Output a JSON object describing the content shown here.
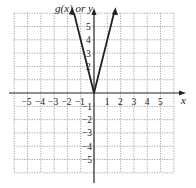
{
  "chart_data": {
    "type": "line",
    "title": "",
    "xlabel": "x",
    "ylabel": "g(x) or y",
    "xlim": [
      -6,
      6
    ],
    "ylim": [
      -6,
      6
    ],
    "grid": true,
    "x_ticks": [
      "-5",
      "-4",
      "-3",
      "-2",
      "-1",
      "1",
      "2",
      "3",
      "4",
      "5"
    ],
    "y_ticks": [
      "5",
      "4",
      "3",
      "2",
      "-1",
      "-2",
      "-3",
      "-4",
      "-5"
    ],
    "series": [
      {
        "name": "g(x) = 4|x|",
        "points": [
          [
            -1.5,
            6
          ],
          [
            0,
            0
          ],
          [
            1.5,
            6
          ]
        ]
      }
    ]
  },
  "labels": {
    "y_axis": "g(x) or y",
    "x_axis": "x"
  }
}
